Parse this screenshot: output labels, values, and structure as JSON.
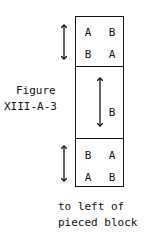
{
  "figure": {
    "label_line1": "Figure",
    "label_line2": "XIII-A-3",
    "caption_line1": "to left of",
    "caption_line2": "pieced block"
  },
  "block": {
    "top_section": {
      "row1": [
        "A",
        "B"
      ],
      "row2": [
        "B",
        "A"
      ]
    },
    "middle_section": {
      "letter": "B"
    },
    "bottom_section": {
      "row1": [
        "B",
        "A"
      ],
      "row2": [
        "A",
        "B"
      ]
    }
  },
  "arrows": [
    {
      "name": "top-section-double-arrow",
      "orientation": "vertical"
    },
    {
      "name": "middle-section-double-arrow",
      "orientation": "vertical"
    },
    {
      "name": "bottom-section-double-arrow",
      "orientation": "vertical"
    }
  ]
}
